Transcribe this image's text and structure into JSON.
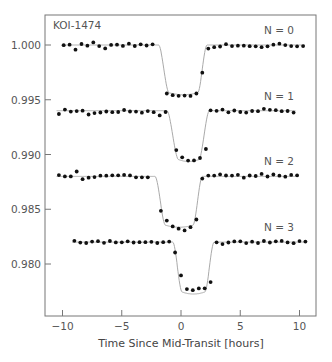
{
  "chart_data": {
    "type": "scatter",
    "title": "KOI-1474",
    "xlabel": "Time Since Mid-Transit [hours]",
    "ylabel": "",
    "xlim": [
      -11.5,
      11.5
    ],
    "ylim": [
      0.9753,
      1.0027
    ],
    "xticks": [
      -10,
      -5,
      0,
      5,
      10
    ],
    "xtick_labels": [
      "−10",
      "−5",
      "0",
      "5",
      "10"
    ],
    "yticks": [
      1.0,
      0.995,
      0.99,
      0.985,
      0.98
    ],
    "ytick_labels": [
      "1.000",
      "0.995",
      "0.990",
      "0.985",
      "0.980"
    ],
    "grid": false,
    "legend": "inline labels",
    "series": [
      {
        "name": "N = 0",
        "baseline": 1.0,
        "depth": 0.0045,
        "ingress_start": -1.9,
        "ingress_end": -1.0,
        "egress_start": 1.4,
        "egress_end": 2.2,
        "x": [
          -9.9,
          -9.4,
          -8.9,
          -8.4,
          -7.9,
          -7.4,
          -6.9,
          -6.4,
          -5.9,
          -5.4,
          -4.9,
          -4.4,
          -3.9,
          -3.4,
          -2.9,
          -2.4,
          -1.2,
          -0.7,
          -0.2,
          0.3,
          0.8,
          1.3,
          1.8,
          2.3,
          2.8,
          3.3,
          3.8,
          4.3,
          4.8,
          5.3,
          5.8,
          6.3,
          6.8,
          7.3,
          7.8,
          8.3,
          8.8,
          9.3,
          9.8,
          10.3
        ],
        "y": [
          0.99998,
          1.00003,
          0.99957,
          1.00009,
          0.99994,
          1.00024,
          0.9999,
          0.99969,
          1.00001,
          1.00003,
          0.99992,
          1.00012,
          0.99991,
          1.00006,
          0.99995,
          1.00006,
          0.99557,
          0.99542,
          0.99536,
          0.99538,
          0.99535,
          0.99557,
          0.99747,
          0.99967,
          0.9998,
          0.99986,
          1.00007,
          0.9999,
          0.99994,
          0.99994,
          0.99989,
          0.99988,
          0.9998,
          0.99988,
          1.00003,
          1.00012,
          0.99999,
          0.9999,
          0.99988,
          0.9999
        ]
      },
      {
        "name": "N = 1",
        "baseline": 0.994,
        "depth": 0.0046,
        "ingress_start": -1.2,
        "ingress_end": -0.2,
        "egress_start": 1.5,
        "egress_end": 2.4,
        "x": [
          -10.3,
          -9.8,
          -9.3,
          -8.8,
          -8.3,
          -7.8,
          -7.3,
          -6.8,
          -6.3,
          -5.8,
          -5.3,
          -4.8,
          -4.3,
          -3.8,
          -3.3,
          -2.8,
          -2.3,
          -1.8,
          -1.3,
          -0.4,
          0.1,
          0.6,
          1.1,
          1.6,
          2.1,
          2.5,
          3.0,
          3.5,
          4.0,
          4.5,
          5.0,
          5.5,
          6.0,
          6.5,
          7.0,
          7.5,
          8.0,
          8.5,
          9.0,
          9.5
        ],
        "y": [
          0.9937,
          0.9941,
          0.99392,
          0.99396,
          0.994,
          0.99365,
          0.99378,
          0.99384,
          0.99393,
          0.99386,
          0.99388,
          0.99406,
          0.99393,
          0.99392,
          0.99382,
          0.99396,
          0.99386,
          0.99357,
          0.99388,
          0.9904,
          0.98974,
          0.98944,
          0.98946,
          0.98968,
          0.9905,
          0.99404,
          0.99399,
          0.9941,
          0.99385,
          0.99402,
          0.99388,
          0.99383,
          0.99397,
          0.99395,
          0.99417,
          0.99408,
          0.99405,
          0.99395,
          0.99397,
          0.99383
        ]
      },
      {
        "name": "N = 2",
        "baseline": 0.988,
        "depth": 0.0046,
        "ingress_start": -2.2,
        "ingress_end": -1.3,
        "egress_start": 1.0,
        "egress_end": 1.8,
        "x": [
          -10.3,
          -9.8,
          -9.3,
          -8.8,
          -8.3,
          -7.8,
          -7.3,
          -6.8,
          -6.3,
          -5.8,
          -5.3,
          -4.8,
          -4.3,
          -3.8,
          -3.3,
          -2.8,
          -1.7,
          -1.2,
          -0.7,
          -0.2,
          0.3,
          0.8,
          1.3,
          1.8,
          2.3,
          2.8,
          3.3,
          3.8,
          4.3,
          4.8,
          5.3,
          5.8,
          6.3,
          6.8,
          7.3,
          7.8,
          8.3,
          8.8,
          9.3,
          9.8
        ],
        "y": [
          0.98812,
          0.988,
          0.988,
          0.98845,
          0.98774,
          0.98788,
          0.98794,
          0.98806,
          0.98806,
          0.9881,
          0.9881,
          0.98814,
          0.98809,
          0.98792,
          0.98792,
          0.98792,
          0.98486,
          0.98396,
          0.98343,
          0.98322,
          0.98307,
          0.98336,
          0.98406,
          0.9878,
          0.98807,
          0.98807,
          0.98818,
          0.98808,
          0.98807,
          0.98815,
          0.98788,
          0.98808,
          0.98804,
          0.98823,
          0.98799,
          0.98817,
          0.98806,
          0.98797,
          0.98814,
          0.9881
        ]
      },
      {
        "name": "N = 3",
        "baseline": 0.982,
        "depth": 0.0047,
        "ingress_start": -0.7,
        "ingress_end": 0.1,
        "egress_start": 2.0,
        "egress_end": 2.8,
        "x": [
          -9.0,
          -8.5,
          -8.0,
          -7.5,
          -7.0,
          -6.5,
          -6.0,
          -5.5,
          -5.0,
          -4.5,
          -4.0,
          -3.5,
          -3.0,
          -2.5,
          -2.0,
          -1.5,
          -1.0,
          -0.5,
          0.0,
          0.5,
          1.0,
          1.5,
          2.0,
          2.5,
          3.0,
          3.5,
          4.0,
          4.5,
          5.0,
          5.5,
          6.0,
          6.5,
          7.0,
          7.5,
          8.0,
          8.5,
          9.0,
          9.5,
          10.0,
          10.5
        ],
        "y": [
          0.98212,
          0.98195,
          0.98192,
          0.98205,
          0.98208,
          0.98194,
          0.9821,
          0.98197,
          0.98198,
          0.98207,
          0.98196,
          0.98199,
          0.98199,
          0.98203,
          0.98192,
          0.98199,
          0.98205,
          0.98105,
          0.97896,
          0.97771,
          0.97761,
          0.97777,
          0.97778,
          0.97835,
          0.98198,
          0.98182,
          0.98196,
          0.98206,
          0.98207,
          0.98191,
          0.98204,
          0.98192,
          0.9821,
          0.98196,
          0.98207,
          0.98211,
          0.98197,
          0.9819,
          0.98209,
          0.98205
        ]
      }
    ]
  },
  "colors": {
    "points": "#111111",
    "model_line": "#aaaaaa",
    "axes": "#777777",
    "text": "#555555"
  }
}
